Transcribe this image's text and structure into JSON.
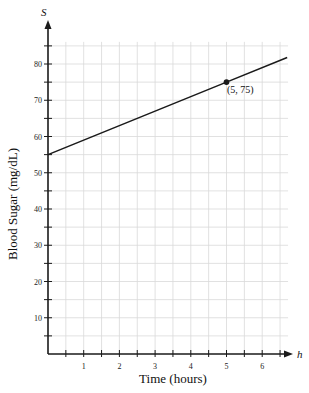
{
  "chart_data": {
    "type": "line",
    "title": "",
    "xlabel": "Time (hours)",
    "ylabel": "Blood Sugar (mg/dL)",
    "x_axis_variable": "h",
    "y_axis_variable": "S",
    "xlim": [
      0,
      6.7
    ],
    "ylim": [
      0,
      88
    ],
    "x_ticks": [
      1,
      2,
      3,
      4,
      5,
      6
    ],
    "y_ticks": [
      10,
      20,
      30,
      40,
      50,
      60,
      70,
      80
    ],
    "grid": true,
    "grid_minor_x": 0.5,
    "grid_minor_y": 5,
    "series": [
      {
        "name": "S(h)",
        "x": [
          0,
          5,
          6.7
        ],
        "values": [
          55,
          75,
          81.8
        ]
      }
    ],
    "points": [
      {
        "x": 5,
        "y": 75,
        "label": "(5, 75)"
      }
    ],
    "annotations": [
      "(5, 75)"
    ],
    "legend": null
  },
  "labels": {
    "x_title": "Time (hours)",
    "y_title": "Blood Sugar (mg/dL)",
    "x_var": "h",
    "y_var": "S",
    "point_label": "(5, 75)",
    "x_ticks": [
      "1",
      "2",
      "3",
      "4",
      "5",
      "6"
    ],
    "y_ticks": [
      "10",
      "20",
      "30",
      "40",
      "50",
      "60",
      "70",
      "80"
    ]
  },
  "colors": {
    "grid": "#d9d9d9",
    "axis": "#1a1a1a",
    "line": "#1a1a1a"
  }
}
